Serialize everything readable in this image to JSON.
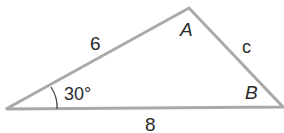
{
  "figure": {
    "type": "triangle",
    "vertices": {
      "left": {
        "label": ""
      },
      "top": {
        "label": "A"
      },
      "right": {
        "label": "B"
      }
    },
    "sides": {
      "left_to_top": "6",
      "top_to_right": "c",
      "bottom": "8"
    },
    "angle_left": "30°",
    "colors": {
      "edge": "#a9a9a9",
      "text": "#2a2a2a",
      "arc": "#444444"
    }
  }
}
